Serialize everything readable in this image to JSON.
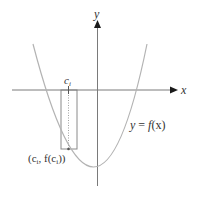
{
  "diagram": {
    "title": "",
    "colors": {
      "background": "#ffffff",
      "axis": "#7a7a7a",
      "curve": "#b3b3b3",
      "rectangle": "#8a8a8a",
      "dotted_line": "#a0a0a0",
      "label": "#333333"
    },
    "axes": {
      "x_label": "x",
      "y_label": "y"
    },
    "curve": {
      "type": "parabola",
      "label": "y = f(x)",
      "label_parts": {
        "lhs": "y",
        "eq": " = ",
        "fname": "f",
        "arg": "(x)"
      }
    },
    "rectangle": {
      "sample_point_label": "c",
      "sample_point_subscript": "i",
      "point_label": "(c",
      "point_label_sub": "i",
      "point_label_mid": ", f(c",
      "point_label_sub2": "i",
      "point_label_end": "))"
    }
  }
}
